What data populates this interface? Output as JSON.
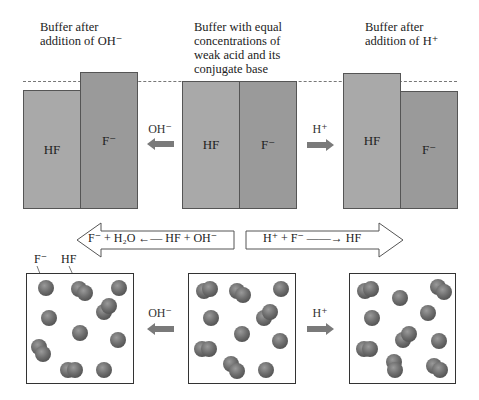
{
  "captions": {
    "left": [
      "Buffer after",
      "addition of OH⁻"
    ],
    "center": [
      "Buffer with equal",
      "concentrations of",
      "weak acid and its",
      "conjugate base"
    ],
    "right": [
      "Buffer after",
      "addition of H⁺"
    ]
  },
  "bars": {
    "left": {
      "hf_label": "HF",
      "f_label": "F⁻"
    },
    "center": {
      "hf_label": "HF",
      "f_label": "F⁻"
    },
    "right": {
      "hf_label": "HF",
      "f_label": "F⁻"
    }
  },
  "arrows": {
    "top_left_label": "OH⁻",
    "top_right_label": "H⁺",
    "bottom_left_label": "OH⁻",
    "bottom_right_label": "H⁺"
  },
  "reactions": {
    "left": "F⁻ + H₂O ←— HF + OH⁻",
    "right": "H⁺ + F⁻ ——→ HF"
  },
  "particle_labels": {
    "f": "F⁻",
    "hf": "HF"
  },
  "colors": {
    "bar_hf": "#a9a9a9",
    "bar_f": "#9a9a9a",
    "arrow_fill": "#7a7a7a",
    "particle": "#6e6e6e"
  }
}
